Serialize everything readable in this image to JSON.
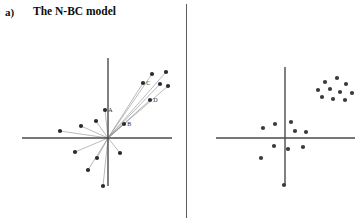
{
  "figure": {
    "background_color": "#ffffff",
    "divider_color": "#5f5f5f"
  },
  "panels": [
    {
      "tag": "a)",
      "title": "The N-BC model",
      "id": "panel-a"
    },
    {
      "tag": "b)",
      "title": "The PE-B model",
      "id": "panel-b"
    }
  ],
  "chart_data": [
    {
      "type": "scatter",
      "title": "The N-BC model",
      "panel_tag": "a)",
      "xlabel": "",
      "ylabel": "",
      "grid": false,
      "legend": false,
      "axes": {
        "style": "crosshair-through-origin",
        "color": "#4a4a4a",
        "origin_px": {
          "x": 108,
          "y": 138
        },
        "x_axis_px": {
          "x1": 22,
          "x2": 172,
          "y": 138
        },
        "y_axis_px": {
          "x": 108,
          "y1": 58,
          "y2": 186
        }
      },
      "rays_from_origin": true,
      "ray_color": "#8c8c8c",
      "point_color": "#2b2b2b",
      "points_px": [
        {
          "x": 152,
          "y": 74,
          "label": "",
          "ray": true
        },
        {
          "x": 166,
          "y": 72,
          "label": "",
          "ray": true
        },
        {
          "x": 143,
          "y": 83,
          "label": "C",
          "ray": true
        },
        {
          "x": 160,
          "y": 84,
          "label": "",
          "ray": true
        },
        {
          "x": 168,
          "y": 86,
          "label": "",
          "ray": true
        },
        {
          "x": 150,
          "y": 100,
          "label": "D",
          "ray": true
        },
        {
          "x": 105,
          "y": 110,
          "label": "A",
          "ray": true
        },
        {
          "x": 124,
          "y": 124,
          "label": "B",
          "ray": true
        },
        {
          "x": 96,
          "y": 121,
          "label": "",
          "ray": true
        },
        {
          "x": 81,
          "y": 126,
          "label": "",
          "ray": true
        },
        {
          "x": 60,
          "y": 131,
          "label": "",
          "ray": true
        },
        {
          "x": 75,
          "y": 152,
          "label": "",
          "ray": true
        },
        {
          "x": 97,
          "y": 158,
          "label": "",
          "ray": true
        },
        {
          "x": 120,
          "y": 153,
          "label": "",
          "ray": true
        },
        {
          "x": 88,
          "y": 170,
          "label": "",
          "ray": true
        },
        {
          "x": 103,
          "y": 186,
          "label": "",
          "ray": true
        }
      ],
      "point_labels": [
        "A",
        "B",
        "C",
        "D"
      ]
    },
    {
      "type": "scatter",
      "title": "The PE-B model",
      "panel_tag": "b)",
      "xlabel": "",
      "ylabel": "",
      "grid": false,
      "legend": false,
      "axes": {
        "style": "crosshair-through-origin",
        "color": "#4a4a4a",
        "origin_px": {
          "x": 285,
          "y": 138
        },
        "x_axis_px": {
          "x1": 216,
          "x2": 355,
          "y": 138
        },
        "y_axis_px": {
          "x": 285,
          "y1": 67,
          "y2": 185
        }
      },
      "rays_from_origin": false,
      "point_color": "#3a3a3a",
      "cluster_note": "tight cluster in upper-right quadrant",
      "points_px": [
        {
          "x": 325,
          "y": 82
        },
        {
          "x": 337,
          "y": 78
        },
        {
          "x": 346,
          "y": 84
        },
        {
          "x": 318,
          "y": 90
        },
        {
          "x": 330,
          "y": 89
        },
        {
          "x": 340,
          "y": 92
        },
        {
          "x": 322,
          "y": 97
        },
        {
          "x": 333,
          "y": 99
        },
        {
          "x": 345,
          "y": 100
        },
        {
          "x": 352,
          "y": 93
        },
        {
          "x": 263,
          "y": 128
        },
        {
          "x": 275,
          "y": 124
        },
        {
          "x": 291,
          "y": 122
        },
        {
          "x": 295,
          "y": 131
        },
        {
          "x": 306,
          "y": 132
        },
        {
          "x": 274,
          "y": 146
        },
        {
          "x": 288,
          "y": 149
        },
        {
          "x": 303,
          "y": 147
        },
        {
          "x": 261,
          "y": 158
        },
        {
          "x": 284,
          "y": 185
        }
      ]
    }
  ]
}
